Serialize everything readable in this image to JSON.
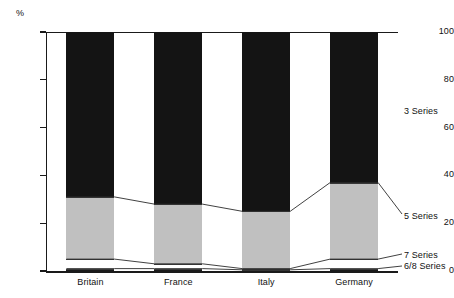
{
  "chart_data": {
    "type": "bar",
    "title": "",
    "subtitle": "",
    "xlabel": "",
    "ylabel": "%",
    "ylim": [
      0,
      100
    ],
    "yticks": [
      0,
      20,
      40,
      60,
      80,
      100
    ],
    "ytick_labels": [
      "0",
      "20",
      "40",
      "60",
      "80",
      "100"
    ],
    "grid": false,
    "legend_position": "right",
    "stacked": true,
    "stack_order_bottom_to_top": [
      "6/8 Series",
      "7 Series",
      "5 Series",
      "3 Series"
    ],
    "categories": [
      "Britain",
      "France",
      "Italy",
      "Germany"
    ],
    "series": [
      {
        "name": "3 Series",
        "values": [
          69,
          72,
          75,
          63
        ],
        "color": "#141414"
      },
      {
        "name": "5 Series",
        "values": [
          26,
          25,
          24,
          32
        ],
        "color": "#c0c0c0"
      },
      {
        "name": "7 Series",
        "values": [
          4,
          2,
          0.5,
          4
        ],
        "color": "#ffffff"
      },
      {
        "name": "6/8 Series",
        "values": [
          1,
          1,
          0.5,
          1
        ],
        "color": "#1a1a1a"
      }
    ],
    "cumulative_tops": {
      "3 Series": [
        100,
        100,
        100,
        100
      ],
      "5 Series": [
        31,
        28,
        25,
        37
      ],
      "7 Series": [
        5,
        3,
        1,
        5
      ],
      "6/8 Series": [
        1,
        1,
        0.5,
        1
      ]
    },
    "legend_entries": [
      "3 Series",
      "5 Series",
      "7 Series",
      "6/8 Series"
    ],
    "annotations": []
  },
  "axis": {
    "unit_label": "%"
  }
}
